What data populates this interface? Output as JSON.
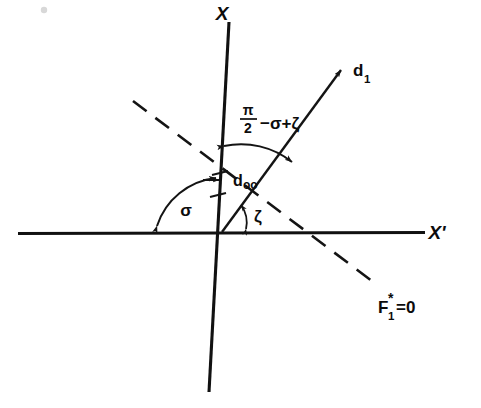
{
  "figure": {
    "title_visible": false,
    "background_color": "#ffffff",
    "ink_color": "#111111"
  },
  "axes": {
    "vertical": {
      "label": "X",
      "name": "x-axis"
    },
    "horizontal": {
      "label": "X'",
      "name": "x-prime-axis"
    }
  },
  "rays": {
    "d1": {
      "label": "d",
      "subscript": "1"
    },
    "dashed": {
      "label": "F",
      "subscript": "1",
      "superscript": "*",
      "equals": "=0",
      "full_label": "F1*=0"
    }
  },
  "markers": {
    "doo": {
      "label": "d",
      "subscript": "oo"
    }
  },
  "angles": {
    "sigma": {
      "label": "σ"
    },
    "zeta": {
      "label": "ζ"
    },
    "compound": {
      "numerator": "π",
      "denominator": "2",
      "rest": "−σ+ζ",
      "full_label": "π/2−σ+ζ"
    }
  }
}
